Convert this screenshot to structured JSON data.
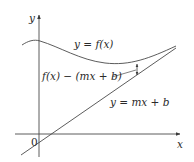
{
  "figure": {
    "axes": {
      "x_label": "x",
      "y_label": "y",
      "origin_label": "0"
    },
    "curve": {
      "label": "y = f(x)"
    },
    "line": {
      "label": "y = mx + b"
    },
    "difference": {
      "label": "f(x) − (mx + b)"
    },
    "colors": {
      "stroke": "#4a4a4a",
      "text": "#2a2a2a",
      "background": "#ffffff"
    }
  }
}
